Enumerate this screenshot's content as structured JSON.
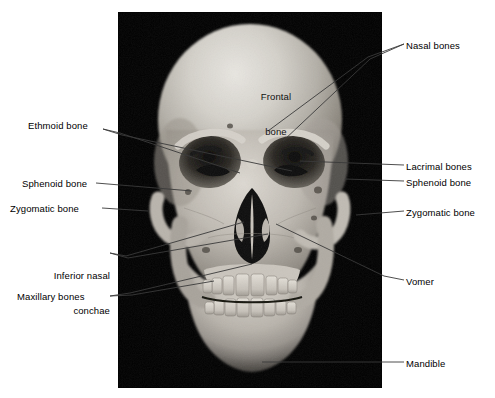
{
  "figure": {
    "background_color": "#ffffff",
    "panel_color": "#010101",
    "label_color": "#000000",
    "leader_color": "#3a3a3a"
  },
  "panel": {
    "left": 118,
    "top": 12,
    "width": 264,
    "height": 376
  },
  "labels": {
    "frontal_bone_line1": "Frontal",
    "frontal_bone_line2": "bone",
    "nasal_bones": "Nasal bones",
    "ethmoid_bone": "Ethmoid bone",
    "lacrimal_bones": "Lacrimal bones",
    "sphenoid_bone_left": "Sphenoid bone",
    "sphenoid_bone_right": "Sphenoid bone",
    "zygomatic_bone_left": "Zygomatic bone",
    "zygomatic_bone_right": "Zygomatic bone",
    "inferior_nasal_conchae_line1": "Inferior nasal",
    "inferior_nasal_conchae_line2": "conchae",
    "maxillary_bones": "Maxillary bones",
    "vomer": "Vomer",
    "mandible": "Mandible"
  },
  "label_positions": {
    "frontal_bone": {
      "x": 252,
      "y": 68,
      "side": "on-photo"
    },
    "nasal_bones": {
      "x": 406,
      "y": 40,
      "side": "right"
    },
    "ethmoid_bone": {
      "x": 28,
      "y": 125,
      "side": "left"
    },
    "lacrimal_bones": {
      "x": 406,
      "y": 161,
      "side": "right"
    },
    "sphenoid_bone_right": {
      "x": 406,
      "y": 177,
      "side": "right"
    },
    "sphenoid_bone_left": {
      "x": 22,
      "y": 178,
      "side": "left"
    },
    "zygomatic_bone_left": {
      "x": 10,
      "y": 203,
      "side": "left"
    },
    "zygomatic_bone_right": {
      "x": 406,
      "y": 207,
      "side": "right"
    },
    "inferior_nasal_conchae": {
      "x": 32,
      "y": 247,
      "side": "left"
    },
    "vomer": {
      "x": 406,
      "y": 276,
      "side": "right"
    },
    "maxillary_bones": {
      "x": 17,
      "y": 291,
      "side": "left"
    },
    "mandible": {
      "x": 406,
      "y": 358,
      "side": "right"
    }
  },
  "leader_lines": [
    {
      "name": "nasal-bones-leader-a",
      "points": "404,44 368,57 268,131"
    },
    {
      "name": "nasal-bones-leader-b",
      "points": "404,44 370,59 283,141"
    },
    {
      "name": "ethmoid-bone-leader-a",
      "points": "103,129 120,133 240,173"
    },
    {
      "name": "ethmoid-bone-leader-b",
      "points": "103,129 122,135 292,171"
    },
    {
      "name": "lacrimal-bones-leader",
      "points": "404,165 300,161"
    },
    {
      "name": "sphenoid-right-leader",
      "points": "404,181 345,179"
    },
    {
      "name": "sphenoid-left-leader",
      "points": "96,183 192,191"
    },
    {
      "name": "zygomatic-left-leader",
      "points": "102,208 148,211"
    },
    {
      "name": "zygomatic-right-leader",
      "points": "404,211 356,215"
    },
    {
      "name": "inferior-nasal-conchae-leader-a",
      "points": "110,253 126,256 244,222"
    },
    {
      "name": "inferior-nasal-conchae-leader-b",
      "points": "110,253 128,258 268,234"
    },
    {
      "name": "maxillary-bones-leader-a",
      "points": "110,296 130,293 252,264"
    },
    {
      "name": "maxillary-bones-leader-b",
      "points": "110,296 132,295 214,281"
    },
    {
      "name": "vomer-leader",
      "points": "404,280 384,276 276,224"
    },
    {
      "name": "mandible-leader",
      "points": "404,362 262,362"
    }
  ]
}
